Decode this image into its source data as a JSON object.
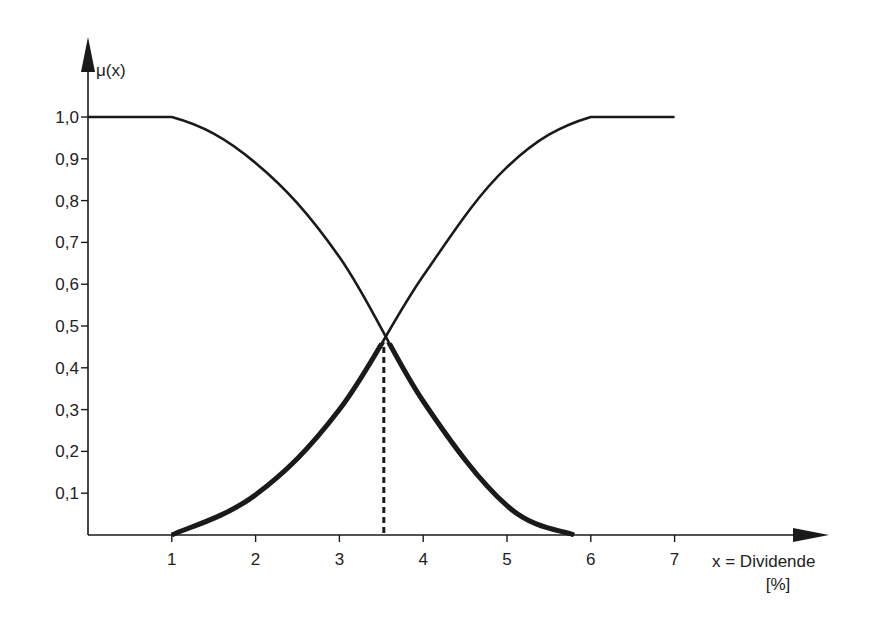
{
  "chart_data": {
    "type": "line",
    "title": "",
    "ylabel": "μ(x)",
    "xlabel": "x = Dividende",
    "xlabel_unit": "[%]",
    "xlim": [
      0,
      8.8
    ],
    "ylim": [
      0,
      1.3
    ],
    "x_ticks": [
      1,
      2,
      3,
      4,
      5,
      6,
      7
    ],
    "x_tick_labels": [
      "1",
      "2",
      "3",
      "4",
      "5",
      "6",
      "7"
    ],
    "y_ticks": [
      0.1,
      0.2,
      0.3,
      0.4,
      0.5,
      0.6,
      0.7,
      0.8,
      0.9,
      1.0
    ],
    "y_tick_labels": [
      "0,1",
      "0,2",
      "0,3",
      "0,4",
      "0,5",
      "0,6",
      "0,7",
      "0,8",
      "0,9",
      "1,0"
    ],
    "grid": false,
    "legend": "none",
    "series": [
      {
        "name": "decreasing-membership",
        "x": [
          0,
          1,
          2,
          3,
          4,
          5,
          5.8
        ],
        "y": [
          1.0,
          1.0,
          0.89,
          0.665,
          0.32,
          0.07,
          0.0
        ]
      },
      {
        "name": "increasing-membership",
        "x": [
          1,
          2,
          3,
          4,
          5,
          6,
          7
        ],
        "y": [
          0.0,
          0.096,
          0.3,
          0.62,
          0.88,
          1.0,
          1.0
        ]
      }
    ],
    "annotations": [
      {
        "type": "dashed-vertical",
        "x": 3.53,
        "y_from": 0,
        "y_to": 0.46,
        "label": "intersection"
      }
    ],
    "highlight": "min of both curves (below intersection) drawn thicker",
    "colors": {
      "line": "#1a1a1a",
      "text": "#222222",
      "background": "#ffffff"
    }
  }
}
